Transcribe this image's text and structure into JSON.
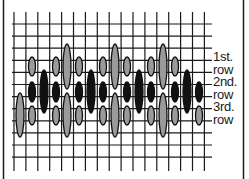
{
  "figure": {
    "colors": {
      "background": "#ffffff",
      "grid": "#1a1a1a",
      "border": "#1a1a1a",
      "stitch_gray": "#9a9a9a",
      "stitch_black": "#111111",
      "stitch_outline": "#111111"
    },
    "grid": {
      "vertical_lines": 17,
      "horizontal_lines": 12,
      "x_start": 14,
      "x_step": 11.9,
      "y_start": 24,
      "y_step": 12.1,
      "h_extent": [
        12,
        212
      ],
      "v_extent": [
        12,
        171
      ]
    },
    "labels": [
      {
        "text": "1st.",
        "y": 50
      },
      {
        "text": "row",
        "y": 63
      },
      {
        "text": "2nd.",
        "y": 75
      },
      {
        "text": "row",
        "y": 88
      },
      {
        "text": "3rd.",
        "y": 100
      },
      {
        "text": "row",
        "y": 113
      }
    ],
    "stitches": [
      {
        "x": 20,
        "type": "gray-tall-lower"
      },
      {
        "x": 32,
        "type": "small-set"
      },
      {
        "x": 44,
        "type": "black-tall"
      },
      {
        "x": 56,
        "type": "small-set"
      },
      {
        "x": 67,
        "type": "gray-tall-pair"
      },
      {
        "x": 79,
        "type": "small-set"
      },
      {
        "x": 91,
        "type": "black-tall"
      },
      {
        "x": 103,
        "type": "small-set"
      },
      {
        "x": 115,
        "type": "gray-tall-pair"
      },
      {
        "x": 127,
        "type": "small-set"
      },
      {
        "x": 139,
        "type": "black-tall"
      },
      {
        "x": 151,
        "type": "small-set"
      },
      {
        "x": 163,
        "type": "gray-tall-pair"
      },
      {
        "x": 175,
        "type": "small-set"
      },
      {
        "x": 187,
        "type": "black-tall"
      },
      {
        "x": 199,
        "type": "small-set-no-top"
      }
    ],
    "stitch_shapes": {
      "gray_tall_top": {
        "y1": 44,
        "y2": 89,
        "w": 8
      },
      "gray_tall_bottom": {
        "y1": 93,
        "y2": 137,
        "w": 8
      },
      "small_gray_top": {
        "y1": 57,
        "y2": 76,
        "w": 7
      },
      "small_black_mid": {
        "y1": 82,
        "y2": 102,
        "w": 7
      },
      "small_gray_bottom": {
        "y1": 106,
        "y2": 125,
        "w": 7
      },
      "black_tall": {
        "y1": 70,
        "y2": 113,
        "w": 8
      }
    }
  }
}
